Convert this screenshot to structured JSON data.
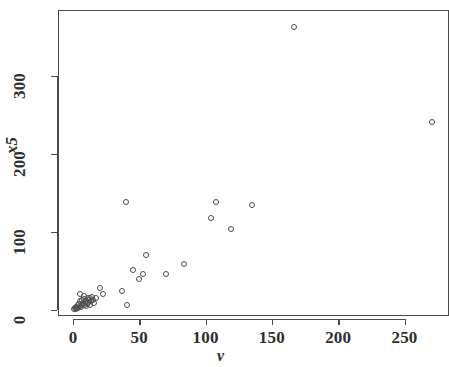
{
  "chart_data": {
    "type": "scatter",
    "title": "",
    "xlabel": "v",
    "ylabel": "x5",
    "xlim": [
      -5,
      280
    ],
    "ylim": [
      -25,
      385
    ],
    "xticks": [
      0,
      50,
      100,
      150,
      200,
      250
    ],
    "yticks": [
      0,
      100,
      200,
      300
    ],
    "xticklabels": [
      "0",
      "50",
      "100",
      "150",
      "200",
      "250"
    ],
    "yticklabels": [
      "0",
      "100",
      "200",
      "300"
    ],
    "grid": false,
    "legend": null,
    "marker": "open-circle",
    "marker_color": "#4d4d4d",
    "points": [
      {
        "x": 1.0,
        "y": 1.0
      },
      {
        "x": 1.5,
        "y": 2.5
      },
      {
        "x": 2.0,
        "y": 1.0
      },
      {
        "x": 2.5,
        "y": 4.0
      },
      {
        "x": 3.0,
        "y": 2.0
      },
      {
        "x": 3.5,
        "y": 6.0
      },
      {
        "x": 4.0,
        "y": 3.0
      },
      {
        "x": 4.5,
        "y": 8.0
      },
      {
        "x": 5.0,
        "y": 5.0
      },
      {
        "x": 5.5,
        "y": 11.0
      },
      {
        "x": 6.0,
        "y": 4.0
      },
      {
        "x": 6.5,
        "y": 13.0
      },
      {
        "x": 7.0,
        "y": 7.0
      },
      {
        "x": 7.5,
        "y": 9.0
      },
      {
        "x": 8.0,
        "y": 6.0
      },
      {
        "x": 8.5,
        "y": 14.0
      },
      {
        "x": 9.0,
        "y": 10.0
      },
      {
        "x": 9.5,
        "y": 5.0
      },
      {
        "x": 10.0,
        "y": 12.0
      },
      {
        "x": 10.5,
        "y": 8.0
      },
      {
        "x": 11.0,
        "y": 16.0
      },
      {
        "x": 11.5,
        "y": 9.0
      },
      {
        "x": 12.0,
        "y": 13.0
      },
      {
        "x": 12.5,
        "y": 6.0
      },
      {
        "x": 13.0,
        "y": 15.0
      },
      {
        "x": 13.5,
        "y": 11.0
      },
      {
        "x": 14.0,
        "y": 17.0
      },
      {
        "x": 15.0,
        "y": 13.0
      },
      {
        "x": 16.0,
        "y": 9.0
      },
      {
        "x": 17.0,
        "y": 16.0
      },
      {
        "x": 5.0,
        "y": 21.0
      },
      {
        "x": 8.0,
        "y": 18.0
      },
      {
        "x": 20.0,
        "y": 28.0
      },
      {
        "x": 23.0,
        "y": 21.0
      },
      {
        "x": 37.0,
        "y": 25.0
      },
      {
        "x": 41.0,
        "y": 7.0
      },
      {
        "x": 40.0,
        "y": 138.0
      },
      {
        "x": 45.0,
        "y": 51.0
      },
      {
        "x": 50.0,
        "y": 40.0
      },
      {
        "x": 53.0,
        "y": 46.0
      },
      {
        "x": 55.0,
        "y": 70.0
      },
      {
        "x": 70.0,
        "y": 46.0
      },
      {
        "x": 84.0,
        "y": 59.0
      },
      {
        "x": 104.0,
        "y": 118.0
      },
      {
        "x": 108.0,
        "y": 139.0
      },
      {
        "x": 119.0,
        "y": 104.0
      },
      {
        "x": 135.0,
        "y": 134.0
      },
      {
        "x": 167.0,
        "y": 363.0
      },
      {
        "x": 271.0,
        "y": 241.0
      }
    ]
  },
  "axes": {
    "x_title": "v",
    "y_title": "x5"
  }
}
